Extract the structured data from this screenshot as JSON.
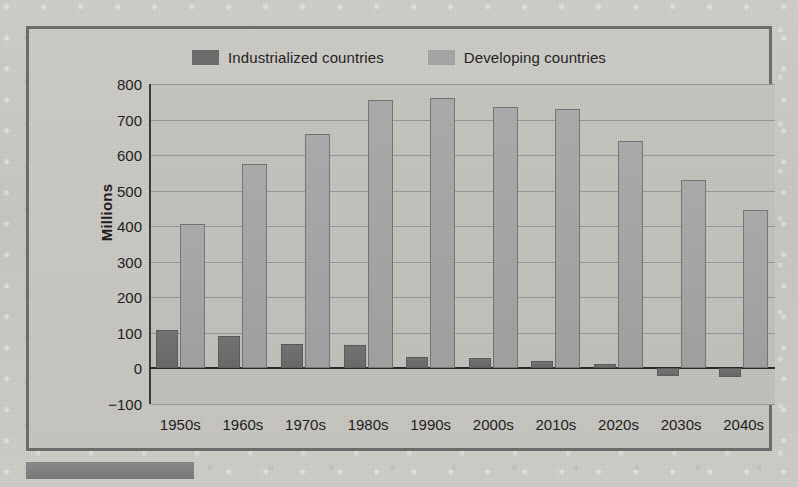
{
  "legend": {
    "entries": [
      {
        "label": "Industrialized countries",
        "color": "#6f6f6f"
      },
      {
        "label": "Developing countries",
        "color": "#a9a9a9"
      }
    ]
  },
  "axis": {
    "y_title": "Millions",
    "y_ticks": [
      "800",
      "700",
      "600",
      "500",
      "400",
      "300",
      "200",
      "100",
      "0",
      "−100"
    ]
  },
  "chart_data": {
    "type": "bar",
    "title": "",
    "subtitle": "",
    "xlabel": "",
    "ylabel": "Millions",
    "ylim": [
      -100,
      800
    ],
    "ytick_values": [
      800,
      700,
      600,
      500,
      400,
      300,
      200,
      100,
      0,
      -100
    ],
    "grid": true,
    "legend_position": "top-center",
    "categories": [
      "1950s",
      "1960s",
      "1970s",
      "1980s",
      "1990s",
      "2000s",
      "2010s",
      "2020s",
      "2030s",
      "2040s"
    ],
    "series": [
      {
        "name": "Industrialized countries",
        "color": "#6f6f6f",
        "values": [
          108,
          92,
          70,
          65,
          33,
          28,
          22,
          12,
          -22,
          -23
        ]
      },
      {
        "name": "Developing countries",
        "color": "#a9a9a9",
        "values": [
          405,
          575,
          660,
          755,
          760,
          735,
          730,
          640,
          530,
          445
        ]
      }
    ]
  }
}
